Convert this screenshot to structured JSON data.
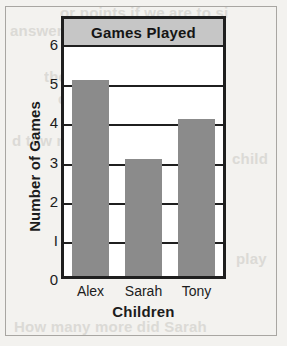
{
  "chart_data": {
    "type": "bar",
    "title": "Games Played",
    "categories": [
      "Alex",
      "Sarah",
      "Tony"
    ],
    "values": [
      5,
      3,
      4
    ],
    "xlabel": "Children",
    "ylabel": "Number of Games",
    "ylim": [
      0,
      6
    ],
    "yticks": [
      "0",
      "1",
      "2",
      "3",
      "4",
      "5",
      "6"
    ],
    "ytick_values": [
      0,
      1,
      2,
      3,
      4,
      5,
      6
    ],
    "grid": true,
    "legend": false,
    "colors": {
      "bar_fill": "#8b8b8b",
      "frame": "#1f1f1f",
      "title_banner": "#c6c6c6",
      "plot_background": "#ffffff",
      "page_background": "#f3f2ef",
      "text": "#1c1c1c"
    }
  },
  "background_text": [
    "or points if we are to si",
    "answer",
    "the number of jumps",
    "children did",
    "d tow many",
    "child",
    "play",
    "How many more did Sarah"
  ]
}
